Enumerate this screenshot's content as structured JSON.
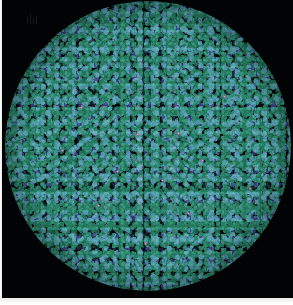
{
  "figure": {
    "kind": "fluorescence-micrograph",
    "modality": "Epifluorescence microscopy",
    "background_color": "#030305",
    "plate_color": "#020304",
    "scan_border_color": "#f4f4f2",
    "caption": ""
  },
  "field_of_view": {
    "shape": "circle",
    "center_x_px": 146,
    "center_y_px": 146,
    "diameter_px": 286,
    "aperture_label": "objective-aperture"
  },
  "channels": [
    {
      "name": "green-channel",
      "fluorophore_color": "#22785C",
      "description": "Dense teal-green punctate signal filling the field, strongest toward the periphery",
      "coverage_percent": 46
    },
    {
      "name": "blue-channel",
      "fluorophore_color": "#3A4288",
      "description": "Blue nuclear-like signal, concentrated toward the centre of the field",
      "coverage_percent": 28
    },
    {
      "name": "violet-overlap",
      "fluorophore_color": "#5C468C",
      "description": "Purple-violet regions where the green and blue channels co-localize",
      "coverage_percent": 12
    },
    {
      "name": "magenta-puncta",
      "fluorophore_color": "#E896C8",
      "description": "Sparse bright magenta point foci scattered across the field",
      "coverage_percent": 1
    }
  ],
  "puncta": [
    {
      "x": 79,
      "y": 107
    },
    {
      "x": 135,
      "y": 134
    },
    {
      "x": 176,
      "y": 133
    },
    {
      "x": 115,
      "y": 171
    },
    {
      "x": 160,
      "y": 180
    },
    {
      "x": 200,
      "y": 160
    },
    {
      "x": 96,
      "y": 205
    },
    {
      "x": 186,
      "y": 213
    },
    {
      "x": 143,
      "y": 243
    },
    {
      "x": 222,
      "y": 96
    },
    {
      "x": 60,
      "y": 150
    },
    {
      "x": 248,
      "y": 188
    }
  ],
  "artifact": {
    "name": "scan-artifact",
    "x": 23,
    "y": 14,
    "description": "Faint vertical streak artifact from the scanned print"
  }
}
